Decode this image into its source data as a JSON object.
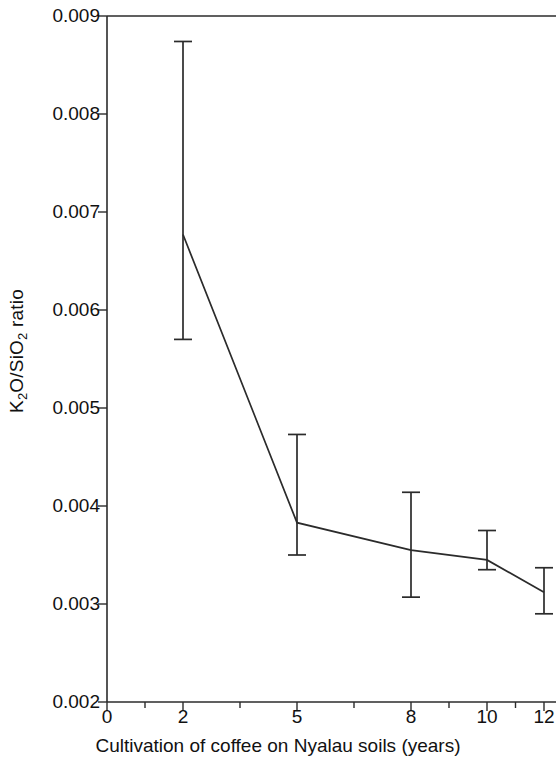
{
  "chart_data": {
    "type": "line",
    "title": "",
    "subtitle": "",
    "xlabel": "Cultivation of coffee on Nyalau soils (years)",
    "ylabel": "K2O/SiO2 ratio",
    "ylabel_parts": {
      "a": "K",
      "a_sub": "2",
      "b": "O/SiO",
      "b_sub": "2",
      "c": " ratio"
    },
    "categories": [
      2,
      5,
      8,
      10,
      12
    ],
    "x_tick_labels": [
      "0",
      "2",
      "5",
      "8",
      "10",
      "12"
    ],
    "y_tick_labels": [
      "0.002",
      "0.003",
      "0.004",
      "0.005",
      "0.006",
      "0.007",
      "0.008",
      "0.009"
    ],
    "y_tick_values": [
      0.002,
      0.003,
      0.004,
      0.005,
      0.006,
      0.007,
      0.008,
      0.009
    ],
    "ylim": [
      0.002,
      0.009
    ],
    "xlim_categorical": true,
    "grid": false,
    "legend": "none",
    "error_bars": true,
    "series": [
      {
        "name": "K2O/SiO2 ratio",
        "values": [
          0.00677,
          0.00383,
          0.00355,
          0.00345,
          0.00312
        ],
        "err_low": [
          0.0057,
          0.0035,
          0.00307,
          0.00335,
          0.0029
        ],
        "err_high": [
          0.00874,
          0.00473,
          0.00414,
          0.00375,
          0.00337
        ]
      }
    ],
    "points": [
      {
        "x": 2,
        "y": 0.00677,
        "low": 0.0057,
        "high": 0.00874
      },
      {
        "x": 5,
        "y": 0.00383,
        "low": 0.0035,
        "high": 0.00473
      },
      {
        "x": 8,
        "y": 0.00355,
        "low": 0.00307,
        "high": 0.00414
      },
      {
        "x": 10,
        "y": 0.00345,
        "low": 0.00335,
        "high": 0.00375
      },
      {
        "x": 12,
        "y": 0.00312,
        "low": 0.0029,
        "high": 0.00337
      }
    ],
    "colors": {
      "line": "#2b2b2b",
      "axis": "#2b2b2b",
      "text": "#111111",
      "background": "#ffffff"
    }
  },
  "axis_geometry": {
    "plot_left": 107,
    "plot_top": 16,
    "plot_bottom": 702,
    "plot_right": 556,
    "x_pixels": {
      "0": 107,
      "2": 183,
      "5": 297,
      "8": 411,
      "10": 487,
      "12": 544
    },
    "y_pixels": {
      "0.009": 16,
      "0.008": 114,
      "0.007": 212,
      "0.006": 310,
      "0.005": 408,
      "0.004": 506,
      "0.003": 604,
      "0.002": 702
    }
  }
}
